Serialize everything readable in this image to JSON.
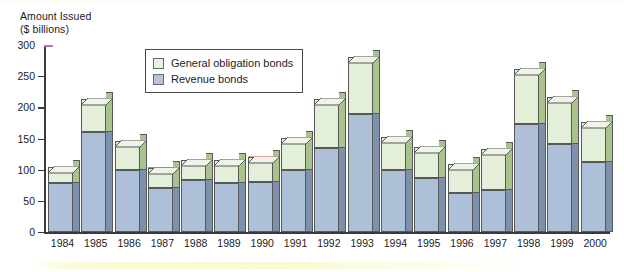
{
  "chart_data": {
    "type": "bar",
    "subtype": "stacked-column-3d",
    "title": "",
    "ylabel": "Amount Issued\n($ billions)",
    "ylabel_line1": "Amount Issued",
    "ylabel_line2": "($ billions)",
    "xlabel": "",
    "ylim": [
      0,
      300
    ],
    "yticks": [
      0,
      50,
      100,
      150,
      200,
      250,
      300
    ],
    "ytick_labels": [
      "0",
      "50",
      "100",
      "150",
      "200",
      "250",
      "300"
    ],
    "grid": false,
    "legend_position": "inside-top-left",
    "categories": [
      "1984",
      "1985",
      "1986",
      "1987",
      "1988",
      "1989",
      "1990",
      "1991",
      "1992",
      "1993",
      "1994",
      "1995",
      "1996",
      "1997",
      "1998",
      "1999",
      "2000"
    ],
    "series": [
      {
        "name": "Revenue bonds",
        "color": "#aec0d7",
        "side_color": "#7d90ac",
        "values": [
          79,
          160,
          100,
          70,
          84,
          78,
          81,
          99,
          135,
          189,
          99,
          87,
          63,
          67,
          173,
          141,
          113
        ]
      },
      {
        "name": "General obligation bonds",
        "color": "#e4efda",
        "side_color": "#a8c48c",
        "values": [
          26,
          54,
          46,
          33,
          31,
          37,
          40,
          52,
          79,
          92,
          54,
          50,
          46,
          66,
          88,
          75,
          64
        ]
      }
    ],
    "totals": [
      105,
      214,
      146,
      103,
      115,
      115,
      121,
      151,
      214,
      281,
      153,
      137,
      109,
      133,
      261,
      216,
      177
    ]
  },
  "legend": {
    "entries": [
      {
        "label": "General obligation bonds",
        "swatch": "gob"
      },
      {
        "label": "Revenue bonds",
        "swatch": "rev"
      }
    ]
  },
  "axis": {
    "title_line1": "Amount Issued",
    "title_line2": "($ billions)"
  }
}
